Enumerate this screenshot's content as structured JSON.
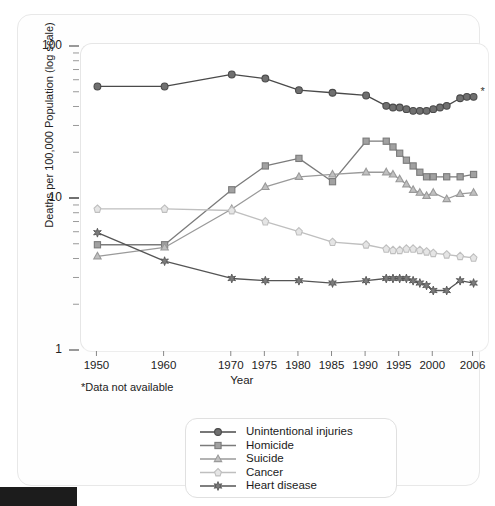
{
  "chart_data": {
    "type": "line",
    "title": "",
    "xlabel": "Year",
    "ylabel": "Deaths per 100,000 Population (log scale)",
    "yscale": "log",
    "ylim": [
      1,
      100
    ],
    "ytick_labels": [
      "1",
      "10",
      "100"
    ],
    "ytick_values": [
      1,
      10,
      100
    ],
    "grid": false,
    "legend_position": "bottom-center",
    "xtick_labels": [
      "1950",
      "1960",
      "1970",
      "1975",
      "1980",
      "1985",
      "1990",
      "1995",
      "2000",
      "2006"
    ],
    "xtick_values": [
      1950,
      1960,
      1970,
      1975,
      1980,
      1985,
      1990,
      1995,
      2000,
      2006
    ],
    "xlim": [
      1948,
      2008
    ],
    "annotations": [
      "*Data not available"
    ],
    "series": [
      {
        "name": "Unintentional injuries",
        "marker": "circle",
        "color": "#4a4a4a",
        "x": [
          1950,
          1960,
          1970,
          1975,
          1980,
          1985,
          1990,
          1993,
          1994,
          1995,
          1996,
          1997,
          1998,
          1999,
          2000,
          2001,
          2002,
          2004,
          2005,
          2006
        ],
        "y": [
          55,
          55,
          66,
          62,
          52,
          50,
          48,
          41,
          40,
          40,
          39,
          38,
          38,
          38,
          39,
          40,
          41,
          46,
          47,
          47
        ]
      },
      {
        "name": "Homicide",
        "marker": "square",
        "color": "#7b7b7b",
        "x": [
          1950,
          1960,
          1970,
          1975,
          1980,
          1985,
          1990,
          1993,
          1994,
          1995,
          1996,
          1997,
          1998,
          1999,
          2000,
          2002,
          2004,
          2006
        ],
        "y": [
          5.0,
          5.0,
          11.5,
          16.5,
          18.5,
          13.0,
          24.0,
          24.0,
          22.0,
          20.0,
          18.0,
          16.5,
          15.0,
          14.0,
          14.0,
          14.0,
          14.0,
          14.5
        ]
      },
      {
        "name": "Suicide",
        "marker": "triangle",
        "color": "#9a9a9a",
        "x": [
          1950,
          1960,
          1970,
          1975,
          1980,
          1985,
          1990,
          1993,
          1994,
          1995,
          1996,
          1997,
          1998,
          1999,
          2000,
          2002,
          2004,
          2006
        ],
        "y": [
          4.2,
          4.8,
          8.6,
          12.0,
          14.0,
          14.5,
          15.0,
          15.0,
          14.5,
          13.5,
          12.5,
          11.5,
          11.0,
          10.5,
          11.0,
          10.0,
          10.8,
          11.0
        ]
      },
      {
        "name": "Cancer",
        "marker": "diamond",
        "color": "#bfbfbf",
        "x": [
          1950,
          1960,
          1970,
          1975,
          1980,
          1985,
          1990,
          1993,
          1994,
          1995,
          1996,
          1997,
          1998,
          1999,
          2000,
          2002,
          2004,
          2006
        ],
        "y": [
          8.6,
          8.6,
          8.4,
          7.1,
          6.1,
          5.2,
          5.0,
          4.7,
          4.6,
          4.6,
          4.7,
          4.7,
          4.6,
          4.5,
          4.4,
          4.3,
          4.2,
          4.1
        ]
      },
      {
        "name": "Heart disease",
        "marker": "star",
        "color": "#555555",
        "x": [
          1950,
          1960,
          1970,
          1975,
          1980,
          1985,
          1990,
          1993,
          1994,
          1995,
          1996,
          1997,
          1998,
          1999,
          2000,
          2002,
          2004,
          2006
        ],
        "y": [
          6.0,
          3.9,
          3.0,
          2.9,
          2.9,
          2.8,
          2.9,
          3.0,
          3.0,
          3.0,
          3.0,
          2.9,
          2.8,
          2.7,
          2.5,
          2.5,
          2.9,
          2.8
        ]
      }
    ]
  },
  "footnote": "*Data not available",
  "axis": {
    "y_title": "Deaths per 100,000 Population (log scale)",
    "x_title": "Year"
  },
  "legend": {
    "items": [
      {
        "label": "Unintentional injuries",
        "marker": "circle",
        "color": "#4a4a4a"
      },
      {
        "label": "Homicide",
        "marker": "square",
        "color": "#7b7b7b"
      },
      {
        "label": "Suicide",
        "marker": "triangle",
        "color": "#9a9a9a"
      },
      {
        "label": "Cancer",
        "marker": "diamond",
        "color": "#bfbfbf"
      },
      {
        "label": "Heart disease",
        "marker": "star",
        "color": "#555555"
      }
    ]
  }
}
